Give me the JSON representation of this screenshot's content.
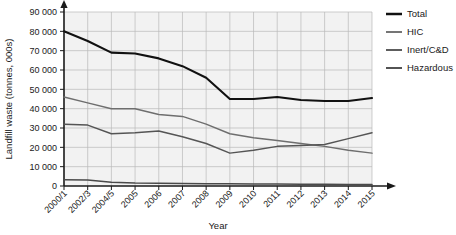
{
  "chart_data": {
    "type": "line",
    "title": "",
    "xlabel": "Year",
    "ylabel": "Landfill waste (tonnes, 000s)",
    "categories": [
      "2000/1",
      "2002/3",
      "2004/5",
      "2005",
      "2006",
      "2007",
      "2008",
      "2009",
      "2010",
      "2011",
      "2012",
      "2013",
      "2014",
      "2015"
    ],
    "ylim": [
      0,
      90000
    ],
    "ytick_labels": [
      "0",
      "10 000",
      "20 000",
      "30 000",
      "40 000",
      "50 000",
      "60 000",
      "70 000",
      "80 000",
      "90 000"
    ],
    "ytick_values": [
      0,
      10000,
      20000,
      30000,
      40000,
      50000,
      60000,
      70000,
      80000,
      90000
    ],
    "grid": true,
    "legend_position": "right",
    "series": [
      {
        "name": "Total",
        "color": "#111111",
        "width": 2.1,
        "values": [
          80000,
          75000,
          69000,
          68500,
          66000,
          62000,
          56000,
          45000,
          45000,
          46000,
          44500,
          44000,
          44000,
          45500
        ]
      },
      {
        "name": "HIC",
        "color": "#6e6e6e",
        "width": 1.5,
        "values": [
          46000,
          43000,
          40000,
          40000,
          37000,
          36000,
          32000,
          27000,
          25000,
          23500,
          22000,
          20500,
          18500,
          17000
        ]
      },
      {
        "name": "Inert/C&D",
        "color": "#555555",
        "width": 1.5,
        "values": [
          32000,
          31500,
          27000,
          27500,
          28500,
          25500,
          22000,
          17000,
          18500,
          20500,
          21000,
          21500,
          24500,
          27500
        ]
      },
      {
        "name": "Hazardous",
        "color": "#4a4a4a",
        "width": 1.5,
        "values": [
          3200,
          3100,
          2000,
          1500,
          1400,
          1300,
          1200,
          1100,
          1000,
          1000,
          900,
          900,
          800,
          800
        ]
      }
    ]
  },
  "legend": {
    "items": [
      {
        "label": "Total"
      },
      {
        "label": "HIC"
      },
      {
        "label": "Inert/C&D"
      },
      {
        "label": "Hazardous"
      }
    ]
  }
}
